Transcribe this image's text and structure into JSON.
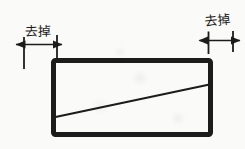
{
  "figure": {
    "colors": {
      "background": "#fafaf8",
      "ink": "#1c1c1c"
    },
    "annotations": {
      "left": {
        "label": "去掉"
      },
      "right": {
        "label": "去掉"
      }
    }
  }
}
